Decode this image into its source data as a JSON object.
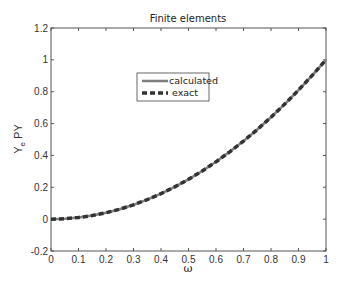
{
  "chart_data": {
    "type": "line",
    "title": "Finite elements",
    "xlabel": "ω",
    "ylabel": "Y_e PY",
    "xlim": [
      0,
      1
    ],
    "ylim": [
      -0.2,
      1.2
    ],
    "xticks": [
      0,
      0.1,
      0.2,
      0.3,
      0.4,
      0.5,
      0.6,
      0.7,
      0.8,
      0.9,
      1
    ],
    "xtick_labels": [
      "0",
      "0.1",
      "0.2",
      "0.3",
      "0.4",
      "0.5",
      "0.6",
      "0.7",
      "0.8",
      "0.9",
      "1"
    ],
    "yticks": [
      -0.2,
      0,
      0.2,
      0.4,
      0.6,
      0.8,
      1,
      1.2
    ],
    "ytick_labels": [
      "-0.2",
      "0",
      "0.2",
      "0.4",
      "0.6",
      "0.8",
      "1",
      "1.2"
    ],
    "grid": false,
    "legend_position": "upper center",
    "x": [
      0,
      0.05,
      0.1,
      0.15,
      0.2,
      0.25,
      0.3,
      0.35,
      0.4,
      0.45,
      0.5,
      0.55,
      0.6,
      0.65,
      0.7,
      0.75,
      0.8,
      0.85,
      0.9,
      0.95,
      1
    ],
    "series": [
      {
        "name": "calculated",
        "style": "solid",
        "color": "#7f7f7f",
        "values": [
          0,
          0.0025,
          0.01,
          0.0225,
          0.04,
          0.0625,
          0.09,
          0.1225,
          0.16,
          0.2025,
          0.25,
          0.3025,
          0.36,
          0.4225,
          0.49,
          0.5625,
          0.64,
          0.7225,
          0.81,
          0.9025,
          1
        ]
      },
      {
        "name": "exact",
        "style": "dashed",
        "color": "#333333",
        "values": [
          0,
          0.0025,
          0.01,
          0.0225,
          0.04,
          0.0625,
          0.09,
          0.1225,
          0.16,
          0.2025,
          0.25,
          0.3025,
          0.36,
          0.4225,
          0.49,
          0.5625,
          0.64,
          0.7225,
          0.81,
          0.9025,
          1
        ]
      }
    ]
  }
}
